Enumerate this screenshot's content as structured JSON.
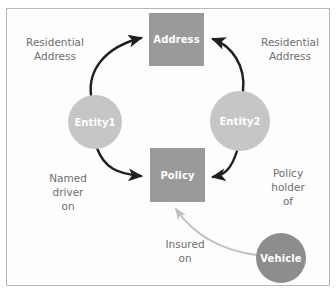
{
  "diagram": {
    "colors": {
      "box_fill": "#9a9a9a",
      "circle_light_fill": "#c6c6c6",
      "circle_dark_fill": "#8d8d8d",
      "node_text": "#ffffff",
      "label_text": "#6f6f6f",
      "arrow_dark": "#1f1f1f",
      "arrow_light": "#bfbfbf",
      "frame_border": "#b9b9b9",
      "background": "#ffffff"
    },
    "nodes": [
      {
        "id": "address",
        "label": "Address",
        "shape": "rectangle",
        "fill": "#9a9a9a"
      },
      {
        "id": "policy",
        "label": "Policy",
        "shape": "rectangle",
        "fill": "#9a9a9a"
      },
      {
        "id": "entity1",
        "label": "Entity1",
        "shape": "circle",
        "fill": "#c6c6c6"
      },
      {
        "id": "entity2",
        "label": "Entity2",
        "shape": "circle",
        "fill": "#c6c6c6"
      },
      {
        "id": "vehicle",
        "label": "Vehicle",
        "shape": "circle",
        "fill": "#8d8d8d"
      }
    ],
    "edges": [
      {
        "id": "entity1-address",
        "from": "entity1",
        "to": "address",
        "label": "Residential\nAddress",
        "style": "dark-curved-arrow"
      },
      {
        "id": "entity2-address",
        "from": "entity2",
        "to": "address",
        "label": "Residential\nAddress",
        "style": "dark-curved-arrow"
      },
      {
        "id": "entity1-policy",
        "from": "entity1",
        "to": "policy",
        "label": "Named\ndriver\non",
        "style": "dark-curved-arrow"
      },
      {
        "id": "entity2-policy",
        "from": "entity2",
        "to": "policy",
        "label": "Policy\nholder\nof",
        "style": "dark-curved-arrow"
      },
      {
        "id": "vehicle-policy",
        "from": "vehicle",
        "to": "policy",
        "label": "Insured\non",
        "style": "light-curved-arrow"
      }
    ]
  }
}
